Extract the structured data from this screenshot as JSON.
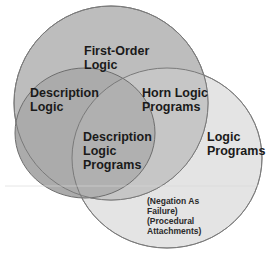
{
  "diagram": {
    "type": "venn",
    "sets": [
      {
        "id": "fol",
        "label_lines": [
          "First-Order",
          "Logic"
        ],
        "fill": "#bfbfbf"
      },
      {
        "id": "dl",
        "label_lines": [
          "Description",
          "Logic"
        ],
        "fill": "#a9a9a9"
      },
      {
        "id": "lp",
        "label_lines": [
          "Logic",
          "Programs"
        ],
        "fill": "#e6e6e6"
      }
    ],
    "regions": {
      "horn": {
        "label_lines": [
          "Horn Logic",
          "Programs"
        ]
      },
      "dlp": {
        "label_lines": [
          "Description",
          "Logic",
          "Programs"
        ]
      }
    },
    "notes": {
      "lines": [
        "(Negation As",
        "Failure)",
        "(Procedural",
        "Attachments)"
      ]
    },
    "colors": {
      "fol_fill": "#bdbdbd",
      "dl_fill": "#a8a8a8",
      "lp_fill": "#e4e4e4",
      "outline": "#7a7a7a",
      "text": "#1a1a1a"
    }
  }
}
